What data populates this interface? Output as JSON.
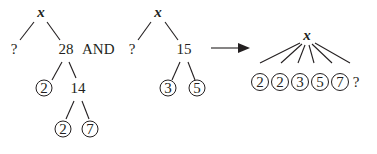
{
  "diagram": {
    "type": "factor-trees",
    "colors": {
      "ink": "#231f20",
      "background": "#ffffff"
    },
    "tree1": {
      "root": "x",
      "left_child": "?",
      "right_child": "28",
      "node_28_children": [
        "2",
        "14"
      ],
      "node_14_children": [
        "2",
        "7"
      ]
    },
    "connector": "AND",
    "tree2": {
      "root": "x",
      "left_child": "?",
      "right_child": "15",
      "node_15_children": [
        "3",
        "5"
      ]
    },
    "arrow": "right-arrow",
    "result_tree": {
      "root": "x",
      "leaves": [
        "2",
        "2",
        "3",
        "5",
        "7",
        "?"
      ]
    }
  }
}
